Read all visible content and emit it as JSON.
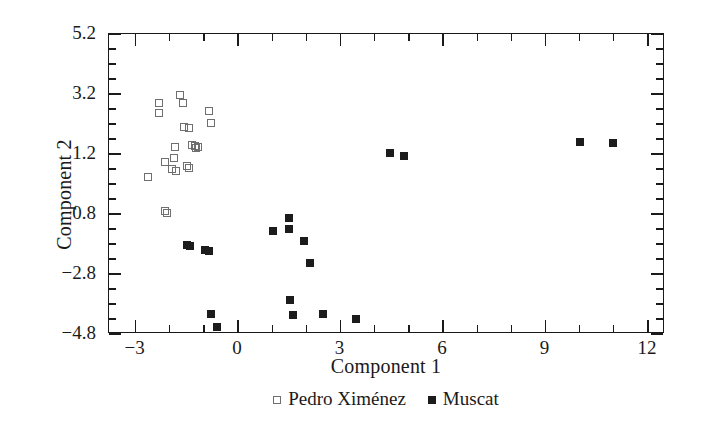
{
  "chart_data": {
    "type": "scatter",
    "title": "",
    "xlabel": "Component 1",
    "ylabel": "Component 2",
    "xlim": [
      -3.78,
      12.5
    ],
    "ylim": [
      -4.8,
      5.2
    ],
    "xticks": [
      -3,
      0,
      3,
      6,
      9,
      12
    ],
    "xtick_labels": [
      "−3",
      "0",
      "3",
      "6",
      "9",
      "12"
    ],
    "yticks": [
      5.2,
      3.2,
      1.2,
      -0.8,
      -2.8,
      -4.8
    ],
    "ytick_labels": [
      "5.2",
      "3.2",
      "1.2",
      "−0.8",
      "−2.8",
      "−4.8"
    ],
    "x_minor_step": 1,
    "y_minor_step": 0.5,
    "grid": false,
    "legend_position": "below-axis-centered",
    "series": [
      {
        "name": "Pedro Ximénez",
        "marker": "open-square",
        "color": "#6f6f6f",
        "fill": "none",
        "points": [
          [
            -2.64,
            0.45
          ],
          [
            -2.32,
            2.9
          ],
          [
            -2.32,
            2.57
          ],
          [
            -2.14,
            0.93
          ],
          [
            -2.14,
            -0.7
          ],
          [
            -2.08,
            -0.77
          ],
          [
            -1.85,
            1.43
          ],
          [
            -1.88,
            1.07
          ],
          [
            -1.94,
            0.7
          ],
          [
            -1.82,
            0.63
          ],
          [
            -1.7,
            3.17
          ],
          [
            -1.61,
            2.9
          ],
          [
            -1.58,
            2.1
          ],
          [
            -1.44,
            2.07
          ],
          [
            -1.5,
            0.8
          ],
          [
            -1.44,
            0.73
          ],
          [
            -1.35,
            1.5
          ],
          [
            -1.26,
            1.47
          ],
          [
            -1.23,
            1.4
          ],
          [
            -1.17,
            1.43
          ],
          [
            -0.85,
            2.63
          ],
          [
            -0.79,
            2.23
          ]
        ]
      },
      {
        "name": "Muscat",
        "marker": "filled-square",
        "color": "#1c1c1c",
        "fill": "solid",
        "points": [
          [
            -1.5,
            -1.83
          ],
          [
            -1.41,
            -1.87
          ],
          [
            -0.97,
            -2.0
          ],
          [
            -0.85,
            -2.03
          ],
          [
            -0.79,
            -4.13
          ],
          [
            -0.62,
            -4.57
          ],
          [
            1.03,
            -1.37
          ],
          [
            1.5,
            -0.93
          ],
          [
            1.5,
            -1.3
          ],
          [
            1.53,
            -3.67
          ],
          [
            1.62,
            -4.17
          ],
          [
            1.94,
            -1.7
          ],
          [
            2.12,
            -2.43
          ],
          [
            2.5,
            -4.13
          ],
          [
            3.44,
            -4.3
          ],
          [
            4.44,
            1.23
          ],
          [
            4.85,
            1.13
          ],
          [
            10.0,
            1.6
          ],
          [
            10.97,
            1.57
          ]
        ]
      }
    ]
  },
  "legend": {
    "items": [
      {
        "label": "Pedro Ximénez",
        "marker": "open-square"
      },
      {
        "label": "Muscat",
        "marker": "filled-square"
      }
    ]
  },
  "axes": {
    "x_title": "Component 1",
    "y_title": "Component 2"
  }
}
